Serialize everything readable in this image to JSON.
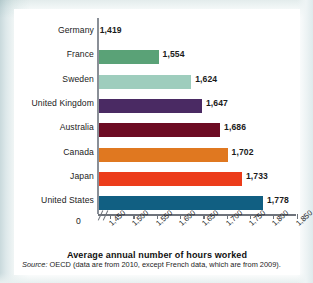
{
  "chart_data": {
    "type": "bar",
    "orientation": "horizontal",
    "title": "",
    "xlabel": "Average annual number of hours worked",
    "ylabel": "",
    "categories": [
      "Germany",
      "France",
      "Sweden",
      "United Kingdom",
      "Australia",
      "Canada",
      "Japan",
      "United States"
    ],
    "values": [
      1419,
      1554,
      1624,
      1647,
      1686,
      1702,
      1733,
      1778
    ],
    "value_labels": [
      "1,419",
      "1,554",
      "1,624",
      "1,647",
      "1,686",
      "1,702",
      "1,733",
      "1,778"
    ],
    "colors": [
      "#eeb722",
      "#5aa277",
      "#9ecdbd",
      "#4a2a63",
      "#6d0b23",
      "#e07820",
      "#ec3c1a",
      "#115f82"
    ],
    "xlim": [
      1425,
      1850
    ],
    "axis_break": true,
    "zero_tick_label": "0",
    "xticks": [
      1450,
      1500,
      1550,
      1600,
      1650,
      1700,
      1750,
      1800,
      1850
    ],
    "xticklabels": [
      "1,450",
      "1,500",
      "1,550",
      "1,600",
      "1,650",
      "1,700",
      "1,750",
      "1,800",
      "1,850"
    ],
    "grid": false,
    "legend": "none",
    "source_prefix": "Source:",
    "source_text": "OECD (data are from 2010, except French data, which are from 2009)."
  }
}
